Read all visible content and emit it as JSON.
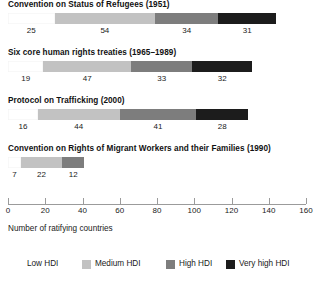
{
  "chart_data": {
    "type": "bar",
    "orientation": "horizontal",
    "stacked": true,
    "title": "",
    "xlabel": "Number of ratifying countries",
    "ylabel": "",
    "xlim": [
      0,
      160
    ],
    "xticks": [
      0,
      20,
      40,
      60,
      80,
      100,
      120,
      140,
      160
    ],
    "xtick_labels": [
      "0",
      "20",
      "40",
      "60",
      "80",
      "100",
      "120",
      "140",
      "160"
    ],
    "grid": false,
    "legend_position": "bottom",
    "categories": [
      "Convention on Status of Refugees (1951)",
      "Six core human rights treaties (1965–1989)",
      "Protocol on Trafficking (2000)",
      "Convention on Rights of Migrant Workers and their Families (1990)"
    ],
    "series": [
      {
        "name": "Low HDI",
        "color": "#ffffff",
        "values": [
          25,
          19,
          16,
          7
        ]
      },
      {
        "name": "Medium HDI",
        "color": "#c2c2c2",
        "values": [
          54,
          47,
          44,
          22
        ]
      },
      {
        "name": "High HDI",
        "color": "#7d7d7d",
        "values": [
          34,
          33,
          41,
          12
        ]
      },
      {
        "name": "Very high HDI",
        "color": "#1c1c1c",
        "values": [
          31,
          32,
          28,
          0
        ]
      }
    ],
    "totals": [
      144,
      131,
      129,
      41
    ]
  },
  "bars": [
    {
      "title": "Convention on Status of Refugees (1951)",
      "segments": [
        {
          "series": "Low HDI",
          "value": 25,
          "label": "25"
        },
        {
          "series": "Medium HDI",
          "value": 54,
          "label": "54"
        },
        {
          "series": "High HDI",
          "value": 34,
          "label": "34"
        },
        {
          "series": "Very high HDI",
          "value": 31,
          "label": "31"
        }
      ]
    },
    {
      "title": "Six core human rights treaties (1965–1989)",
      "segments": [
        {
          "series": "Low HDI",
          "value": 19,
          "label": "19"
        },
        {
          "series": "Medium HDI",
          "value": 47,
          "label": "47"
        },
        {
          "series": "High HDI",
          "value": 33,
          "label": "33"
        },
        {
          "series": "Very high HDI",
          "value": 32,
          "label": "32"
        }
      ]
    },
    {
      "title": "Protocol on Trafficking (2000)",
      "segments": [
        {
          "series": "Low HDI",
          "value": 16,
          "label": "16"
        },
        {
          "series": "Medium HDI",
          "value": 44,
          "label": "44"
        },
        {
          "series": "High HDI",
          "value": 41,
          "label": "41"
        },
        {
          "series": "Very high HDI",
          "value": 28,
          "label": "28"
        }
      ]
    },
    {
      "title": "Convention on Rights of Migrant Workers and their Families (1990)",
      "segments": [
        {
          "series": "Low HDI",
          "value": 7,
          "label": "7"
        },
        {
          "series": "Medium HDI",
          "value": 22,
          "label": "22"
        },
        {
          "series": "High HDI",
          "value": 12,
          "label": "12"
        }
      ]
    }
  ],
  "axis": {
    "caption": "Number of ratifying countries",
    "ticks": [
      "0",
      "20",
      "40",
      "60",
      "80",
      "100",
      "120",
      "140",
      "160"
    ]
  },
  "legend": [
    {
      "label": "Low HDI",
      "key": "low"
    },
    {
      "label": "Medium HDI",
      "key": "medium"
    },
    {
      "label": "High HDI",
      "key": "high"
    },
    {
      "label": "Very high HDI",
      "key": "veryhigh"
    }
  ]
}
